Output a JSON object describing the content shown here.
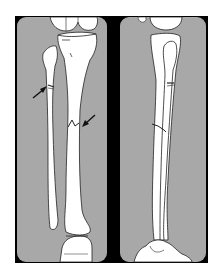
{
  "figure": {
    "type": "anatomical-illustration",
    "panels": [
      {
        "id": "ap-view",
        "view": "anteroposterior",
        "annotations": [
          {
            "type": "arrow",
            "target": "fibula fracture",
            "direction": "down-right"
          },
          {
            "type": "arrow",
            "target": "tibia fracture",
            "direction": "down-left"
          }
        ]
      },
      {
        "id": "lateral-view",
        "view": "lateral",
        "annotations": []
      }
    ],
    "colors": {
      "background": "#ffffff",
      "frame": "#000000",
      "panel": "#a8a8a8",
      "bone": "#ffffff",
      "outline": "#222222"
    }
  }
}
